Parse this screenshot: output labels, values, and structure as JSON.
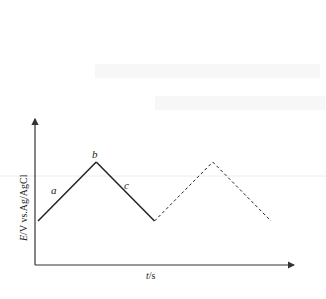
{
  "figure": {
    "y_axis_label": {
      "variable": "E",
      "unit_text": "/V  vs.Ag/AgCl"
    },
    "x_axis_label": {
      "variable": "t",
      "unit_text": "/s"
    },
    "segment_labels": {
      "a": "a",
      "b": "b",
      "c": "c"
    },
    "waveform": {
      "type": "triangular potential sweep",
      "solid_cycle": [
        {
          "t": 0,
          "E": 0.2
        },
        {
          "t": 1,
          "E": 1.0
        },
        {
          "t": 2,
          "E": 0.2
        }
      ],
      "dashed_cycle": [
        {
          "t": 2,
          "E": 0.2
        },
        {
          "t": 3,
          "E": 1.0
        },
        {
          "t": 4,
          "E": 0.2
        }
      ]
    },
    "colors": {
      "line": "#222222",
      "axis": "#333333",
      "artifact": "#ececec"
    }
  }
}
